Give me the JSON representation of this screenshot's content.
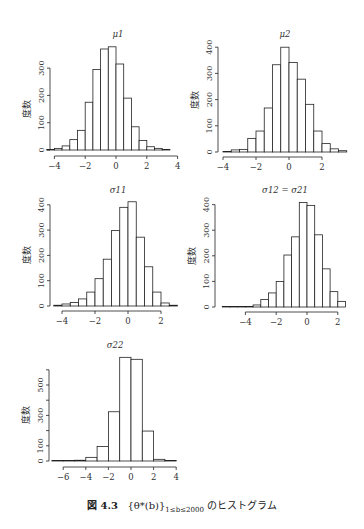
{
  "caption": {
    "label": "図 4.3",
    "math": "{θ*(b)}",
    "subscript": "1≤b≤2000",
    "text": "のヒストグラム"
  },
  "ylabel": "度数",
  "chart_data": [
    {
      "type": "histogram",
      "title": "μ1",
      "ylabel": "度数",
      "xticks": [
        -4,
        -2,
        0,
        2,
        4
      ],
      "yticks": [
        0,
        100,
        200,
        300
      ],
      "bin_width": 0.5,
      "bin_start": -4.5,
      "values": [
        2,
        6,
        15,
        38,
        72,
        175,
        295,
        370,
        378,
        315,
        190,
        85,
        35,
        12,
        6,
        2
      ],
      "frame": {
        "x0": 116,
        "ppu": 15.4,
        "y0": 150,
        "ppy": 0.273,
        "axisX": 50,
        "axisY": 156,
        "yTop": 68,
        "titleX": 118,
        "titleY": 37
      }
    },
    {
      "type": "histogram",
      "title": "μ2",
      "ylabel": "度数",
      "xticks": [
        -4,
        -2,
        0,
        2
      ],
      "yticks": [
        0,
        100,
        200,
        300,
        400
      ],
      "bin_width": 0.5,
      "bin_start": -4.0,
      "values": [
        2,
        8,
        10,
        52,
        80,
        168,
        333,
        400,
        342,
        278,
        182,
        80,
        32,
        12,
        5
      ],
      "frame": {
        "x0": 289,
        "ppu": 16.5,
        "y0": 152,
        "ppy": 0.262,
        "axisX": 218,
        "axisY": 157,
        "yTop": 47,
        "titleX": 285,
        "titleY": 37
      }
    },
    {
      "type": "histogram",
      "title": "σ11",
      "ylabel": "度数",
      "xticks": [
        -4,
        -2,
        0,
        2
      ],
      "yticks": [
        0,
        100,
        200,
        300,
        400
      ],
      "bin_width": 0.5,
      "bin_start": -4.5,
      "values": [
        3,
        8,
        14,
        28,
        55,
        108,
        185,
        298,
        390,
        412,
        272,
        155,
        55,
        12,
        3
      ],
      "frame": {
        "x0": 128,
        "ppu": 16.5,
        "y0": 306,
        "ppy": 0.253,
        "axisX": 50,
        "axisY": 311,
        "yTop": 205,
        "titleX": 118,
        "titleY": 193
      }
    },
    {
      "type": "histogram",
      "title": "σ12 = σ21",
      "ylabel": "度数",
      "xticks": [
        -4,
        -2,
        0,
        2
      ],
      "yticks": [
        0,
        100,
        200,
        300,
        400
      ],
      "bin_width": 0.5,
      "bin_start": -5.5,
      "values": [
        1,
        1,
        2,
        2,
        8,
        29,
        55,
        100,
        203,
        274,
        408,
        397,
        282,
        149,
        60,
        22
      ],
      "frame": {
        "x0": 307,
        "ppu": 15.4,
        "y0": 307,
        "ppy": 0.256,
        "axisX": 215,
        "axisY": 312,
        "yTop": 205,
        "titleX": 285,
        "titleY": 193
      }
    },
    {
      "type": "histogram",
      "title": "σ22",
      "ylabel": "度数",
      "xticks": [
        -6,
        -4,
        -2,
        0,
        2,
        4
      ],
      "yticks": [
        0,
        100,
        300,
        500
      ],
      "minor_yticks": [
        200,
        400,
        600
      ],
      "bin_width": 1,
      "bin_start": -7,
      "values": [
        1,
        3,
        5,
        24,
        95,
        324,
        682,
        669,
        197,
        11,
        2
      ],
      "frame": {
        "x0": 131,
        "ppu": 11.3,
        "y0": 461,
        "ppy": 0.152,
        "axisX": 49,
        "axisY": 467,
        "yTop": 369,
        "titleX": 115,
        "titleY": 348
      }
    }
  ]
}
